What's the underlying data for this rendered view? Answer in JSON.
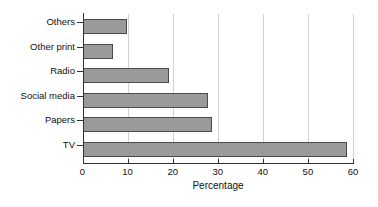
{
  "chart_data": {
    "type": "bar",
    "orientation": "horizontal",
    "title": "",
    "xlabel": "Percentage",
    "ylabel": "",
    "categories": [
      "TV",
      "Papers",
      "Social media",
      "Radio",
      "Other print",
      "Others"
    ],
    "values": [
      58.6,
      28.8,
      27.9,
      19.2,
      6.8,
      9.8
    ],
    "xlim": [
      0,
      60
    ],
    "xticks": [
      0,
      10,
      20,
      30,
      40,
      50,
      60
    ],
    "xtick_labels": [
      "0",
      "10",
      "20",
      "30",
      "40",
      "50",
      "60"
    ],
    "grid": "vertical",
    "legend": "none",
    "bar_fill_color": "#9a9a9a",
    "bar_edge_color": "#4a4a4a",
    "gridline_color": "#d2d2d2",
    "axis_color": "#333333",
    "background_color": "#ffffff"
  }
}
